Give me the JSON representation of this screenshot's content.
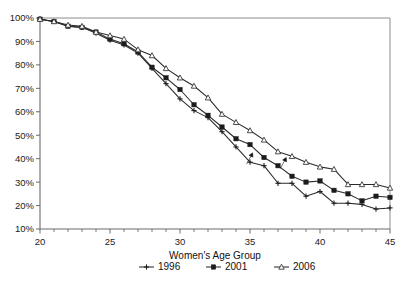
{
  "chart_data": {
    "type": "line",
    "title": "",
    "subtitle": "",
    "xlabel": "Women's Age Group",
    "ylabel": "",
    "xlim": [
      20,
      45
    ],
    "ylim": [
      10,
      100
    ],
    "grid": false,
    "legend_position": "bottom",
    "x_tick_labels": [
      "20",
      "25",
      "30",
      "35",
      "40",
      "45"
    ],
    "x_tick_values": [
      20,
      25,
      30,
      35,
      40,
      45
    ],
    "x_minor_tick_step": 1,
    "y_tick_labels": [
      "10%",
      "20%",
      "30%",
      "40%",
      "50%",
      "60%",
      "70%",
      "80%",
      "90%",
      "100%"
    ],
    "y_tick_values": [
      10,
      20,
      30,
      40,
      50,
      60,
      70,
      80,
      90,
      100
    ],
    "y_unit": "%",
    "x": [
      20,
      21,
      22,
      23,
      24,
      25,
      26,
      27,
      28,
      29,
      30,
      31,
      32,
      33,
      34,
      35,
      36,
      37,
      38,
      39,
      40,
      41,
      42,
      43,
      44,
      45
    ],
    "series": [
      {
        "name": "1996",
        "marker": "plus",
        "values": [
          99.5,
          98.5,
          96.5,
          96.0,
          93.5,
          90.5,
          88.5,
          85.0,
          78.5,
          72.0,
          65.5,
          60.5,
          57.5,
          51.5,
          45.0,
          38.5,
          37.0,
          29.5,
          29.5,
          24.0,
          26.0,
          21.0,
          21.0,
          20.5,
          18.5,
          19.0
        ]
      },
      {
        "name": "2001",
        "marker": "square",
        "values": [
          99.5,
          98.5,
          96.5,
          96.0,
          94.0,
          91.0,
          89.0,
          85.5,
          79.0,
          74.5,
          69.5,
          63.0,
          58.5,
          53.5,
          48.5,
          46.0,
          40.5,
          37.0,
          32.5,
          30.0,
          30.5,
          26.5,
          25.0,
          22.0,
          24.0,
          23.5
        ]
      },
      {
        "name": "2006",
        "marker": "triangle",
        "values": [
          99.5,
          98.5,
          97.0,
          96.5,
          94.0,
          92.5,
          91.0,
          86.5,
          84.0,
          78.5,
          74.5,
          71.0,
          66.0,
          59.0,
          55.5,
          52.0,
          48.0,
          43.0,
          41.0,
          38.5,
          36.5,
          35.5,
          29.0,
          29.0,
          29.0,
          27.5
        ]
      }
    ],
    "annotations": [
      {
        "kind": "arrow",
        "label": "",
        "x": 35.0,
        "y": 40.5,
        "direction": "up-right"
      },
      {
        "kind": "arrow",
        "label": "",
        "x": 37.4,
        "y": 38.5,
        "direction": "up-right"
      }
    ],
    "colors": {
      "line": "#2a2a2a",
      "marker_fill_filled": "#1c1c1c",
      "marker_fill_open": "#ffffff",
      "axis": "#6b6b6b",
      "frame": "#8d8d8d",
      "text": "#111111",
      "background": "#ffffff"
    }
  },
  "legend": {
    "items": [
      {
        "label": "1996",
        "marker": "plus"
      },
      {
        "label": "2001",
        "marker": "square"
      },
      {
        "label": "2006",
        "marker": "triangle"
      }
    ]
  }
}
